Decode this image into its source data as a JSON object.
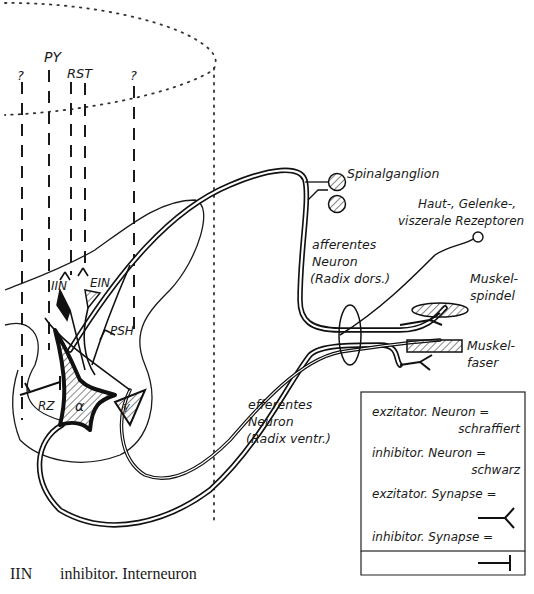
{
  "diagram": {
    "tract_labels": {
      "py": "PY",
      "rst": "RST",
      "unknown_left": "?",
      "unknown_right": "?"
    },
    "cell_labels": {
      "iin": "IIN",
      "ein": "EIN",
      "psh": "PSH",
      "rz": "RZ",
      "alpha": "α",
      "gamma": "γ"
    },
    "structures": {
      "spinal_ganglion": "Spinalganglion",
      "receptors_line1": "Haut-, Gelenke-,",
      "receptors_line2": "viszerale Rezeptoren",
      "afferent_line1": "afferentes",
      "afferent_line2": "Neuron",
      "afferent_line3": "(Radix dors.)",
      "muscle_spindle_line1": "Muskel-",
      "muscle_spindle_line2": "spindel",
      "muscle_fiber_line1": "Muskel-",
      "muscle_fiber_line2": "faser",
      "efferent_line1": "efferentes",
      "efferent_line2": "Neuron",
      "efferent_line3": "(Radix ventr.)"
    },
    "legend": {
      "excitatory_neuron": "exzitator. Neuron =",
      "excitatory_neuron_value": "schraffiert",
      "inhibitory_neuron": "inhibitor. Neuron =",
      "inhibitory_neuron_value": "schwarz",
      "excitatory_synapse": "exzitator. Synapse =",
      "inhibitory_synapse": "inhibitor. Synapse ="
    }
  },
  "caption": {
    "abbreviation": "IIN",
    "definition": "inhibitor. Interneuron"
  }
}
